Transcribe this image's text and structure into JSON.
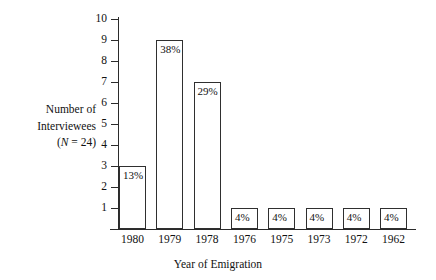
{
  "chart_data": {
    "type": "bar",
    "title": "",
    "xlabel": "Year of Emigration",
    "ylabel_lines": [
      "Number of",
      "Interviewees",
      "(N = 24)"
    ],
    "ylabel_italic_token": "N",
    "ylabel_plain": "Number of Interviewees (N = 24)",
    "categories": [
      "1980",
      "1979",
      "1978",
      "1976",
      "1975",
      "1973",
      "1972",
      "1962"
    ],
    "values": [
      3,
      9,
      7,
      1,
      1,
      1,
      1,
      1
    ],
    "data_labels": [
      "13%",
      "38%",
      "29%",
      "4%",
      "4%",
      "4%",
      "4%",
      "4%"
    ],
    "ylim": [
      0,
      10
    ],
    "yticks": [
      1,
      2,
      3,
      4,
      5,
      6,
      7,
      8,
      9,
      10
    ],
    "ytick_labels": [
      "1",
      "2",
      "3",
      "4",
      "5",
      "6",
      "7",
      "8",
      "9",
      "10"
    ],
    "grid": false,
    "legend": "none",
    "total_n": 24,
    "colors": {
      "bar_fill": "#ffffff",
      "bar_stroke": "#2f2f2f",
      "axis": "#2b2b2b",
      "text": "#111111",
      "background": "#ffffff"
    }
  }
}
